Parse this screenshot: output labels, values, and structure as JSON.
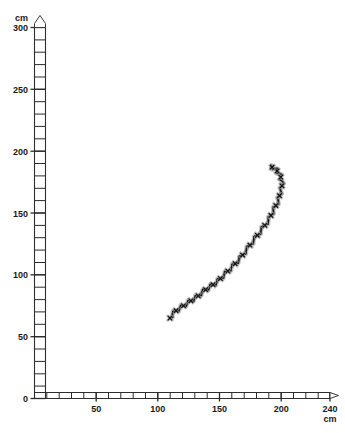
{
  "chart_data": {
    "type": "line",
    "title": "",
    "subtitle": "",
    "xlabel": "cm",
    "ylabel": "cm",
    "x_unit_label": "cm",
    "y_unit_label": "cm",
    "xlim": [
      0,
      240
    ],
    "ylim": [
      0,
      300
    ],
    "x_ticks_major": [
      50,
      100,
      150,
      200,
      240
    ],
    "x_tick_labels": [
      "50",
      "100",
      "150",
      "200",
      "240"
    ],
    "y_ticks_major": [
      0,
      50,
      100,
      150,
      200,
      250,
      300
    ],
    "y_tick_labels": [
      "0",
      "50",
      "100",
      "150",
      "200",
      "250",
      "300"
    ],
    "x_tick_minor_step": 10,
    "y_tick_minor_step": 10,
    "origin_label": "0",
    "grid": false,
    "legend": null,
    "axis_style": "ruler-ladder-with-arrowhead",
    "series": [
      {
        "name": "trajectory",
        "color": "#101010",
        "halo_color": "#9a9a9a",
        "marker": "cross-jagged",
        "x": [
          110,
          112,
          115,
          118,
          121,
          124,
          127,
          130,
          133,
          136,
          139,
          142,
          145,
          148,
          151,
          154,
          157,
          160,
          163,
          166,
          169,
          172,
          175,
          178,
          181,
          184,
          187,
          190,
          192,
          194,
          196,
          198,
          199,
          200,
          201,
          201,
          200,
          199,
          197,
          195,
          193,
          192
        ],
        "y": [
          65,
          68,
          71,
          73,
          75,
          77,
          79,
          81,
          83,
          86,
          88,
          90,
          92,
          94,
          97,
          100,
          103,
          106,
          109,
          112,
          116,
          120,
          124,
          128,
          132,
          136,
          140,
          144,
          148,
          152,
          156,
          160,
          164,
          168,
          172,
          176,
          179,
          182,
          184,
          186,
          187,
          187
        ]
      }
    ],
    "annotations": []
  },
  "axes": {
    "y_axis_name": "vertical-cm-ruler",
    "x_axis_name": "horizontal-cm-ruler",
    "y_top_unit": "cm",
    "x_end_unit": "cm",
    "origin": "0"
  }
}
